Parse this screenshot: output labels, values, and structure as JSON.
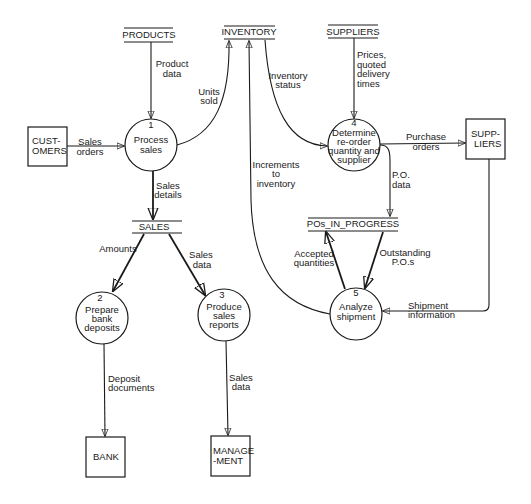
{
  "diagram": {
    "type": "data-flow-diagram",
    "entities": [
      {
        "id": "customers",
        "lines": [
          "CUST-",
          "OMERS"
        ]
      },
      {
        "id": "suppliers-entity",
        "lines": [
          "SUPP-",
          "LIERS"
        ]
      },
      {
        "id": "bank",
        "lines": [
          "BANK"
        ]
      },
      {
        "id": "management",
        "lines": [
          "MANAGE",
          "-MENT"
        ]
      }
    ],
    "stores": [
      {
        "id": "products",
        "label": "PRODUCTS"
      },
      {
        "id": "inventory",
        "label": "INVENTORY"
      },
      {
        "id": "suppliers-store",
        "label": "SUPPLIERS"
      },
      {
        "id": "sales",
        "label": "SALES"
      },
      {
        "id": "pos-in-progress",
        "label": "POs_IN_PROGRESS"
      }
    ],
    "processes": [
      {
        "id": "p1",
        "number": "1",
        "lines": [
          "Process",
          "sales"
        ]
      },
      {
        "id": "p2",
        "number": "2",
        "lines": [
          "Prepare",
          "bank",
          "deposits"
        ]
      },
      {
        "id": "p3",
        "number": "3",
        "lines": [
          "Produce",
          "sales",
          "reports"
        ]
      },
      {
        "id": "p4",
        "number": "4",
        "lines": [
          "Determine",
          "re-order",
          "quantity and",
          "supplier"
        ]
      },
      {
        "id": "p5",
        "number": "5",
        "lines": [
          "Analyze",
          "shipment"
        ]
      }
    ],
    "flows": [
      {
        "id": "product-data",
        "lines": [
          "Product",
          "data"
        ]
      },
      {
        "id": "units-sold",
        "lines": [
          "Units",
          "sold"
        ]
      },
      {
        "id": "sales-orders",
        "lines": [
          "Sales",
          "orders"
        ]
      },
      {
        "id": "sales-details",
        "lines": [
          "Sales",
          "details"
        ]
      },
      {
        "id": "inventory-status",
        "lines": [
          "Inventory",
          "status"
        ]
      },
      {
        "id": "prices",
        "lines": [
          "Prices,",
          "quoted",
          "delivery",
          "times"
        ]
      },
      {
        "id": "purchase-orders",
        "lines": [
          "Purchase",
          "orders"
        ]
      },
      {
        "id": "po-data",
        "lines": [
          "P.O.",
          "data"
        ]
      },
      {
        "id": "increments",
        "lines": [
          "Increments",
          "to",
          "inventory"
        ]
      },
      {
        "id": "amounts",
        "lines": [
          "Amounts"
        ]
      },
      {
        "id": "sales-data-1",
        "lines": [
          "Sales",
          "data"
        ]
      },
      {
        "id": "accepted-quantities",
        "lines": [
          "Accepted",
          "quantities"
        ]
      },
      {
        "id": "outstanding-pos",
        "lines": [
          "Outstanding",
          "P.O.s"
        ]
      },
      {
        "id": "shipment-info",
        "lines": [
          "Shipment",
          "information"
        ]
      },
      {
        "id": "deposit-documents",
        "lines": [
          "Deposit",
          "documents"
        ]
      },
      {
        "id": "sales-data-2",
        "lines": [
          "Sales",
          "data"
        ]
      }
    ]
  }
}
